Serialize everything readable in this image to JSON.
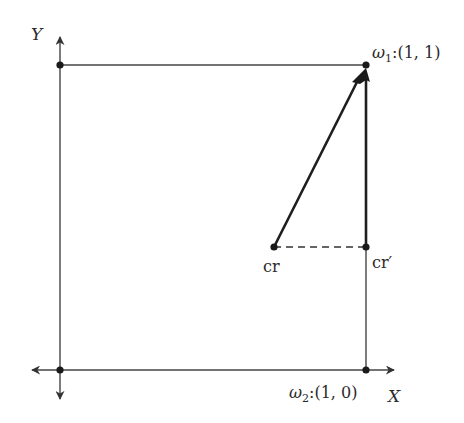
{
  "diagram": {
    "colors": {
      "stroke": "#333333",
      "thick_stroke": "#1e1e1e",
      "text": "#2a2a2a",
      "background": "#ffffff"
    },
    "axes": {
      "x_label": "X",
      "y_label": "Y"
    },
    "points": {
      "omega1": {
        "label_sym": "ω",
        "label_sub": "1",
        "label_coords": ":(1, 1)"
      },
      "omega2": {
        "label_sym": "ω",
        "label_sub": "2",
        "label_coords": ":(1, 0)"
      },
      "cr": {
        "label": "cr"
      },
      "cr_prime": {
        "label": "cr′"
      }
    },
    "edges": [
      {
        "from": "origin",
        "to": "top-left",
        "style": "solid"
      },
      {
        "from": "top-left",
        "to": "omega1",
        "style": "solid"
      },
      {
        "from": "omega1",
        "to": "omega2",
        "style": "solid"
      },
      {
        "from": "cr",
        "to": "omega1",
        "style": "arrow-thick"
      },
      {
        "from": "cr_prime",
        "to": "omega1",
        "style": "arrow-thick"
      },
      {
        "from": "cr",
        "to": "cr_prime",
        "style": "dashed"
      }
    ]
  }
}
